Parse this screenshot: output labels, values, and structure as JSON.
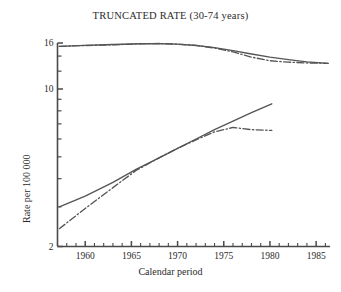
{
  "chart_data": {
    "type": "line",
    "title": "TRUNCATED RATE (30-74 years)",
    "xlabel": "Calendar period",
    "ylabel": "Rate per 100 000",
    "yscale": "log",
    "ylim": [
      2,
      16
    ],
    "xlim": [
      1957,
      1986.5
    ],
    "grid": false,
    "legend": "none",
    "ytick_labels": [
      "16",
      "10",
      "2"
    ],
    "ytick_values": [
      16,
      10,
      2
    ],
    "xtick_labels": [
      "1960",
      "1965",
      "1970",
      "1975",
      "1980",
      "1985"
    ],
    "xtick_values": [
      1960,
      1965,
      1970,
      1975,
      1980,
      1985
    ],
    "xminor_step": 1,
    "series": [
      {
        "name": "upper-fitted",
        "style": "solid",
        "color": "#555555",
        "points": [
          [
            1957.2,
            15.45
          ],
          [
            1960.0,
            15.62
          ],
          [
            1963.0,
            15.75
          ],
          [
            1966.0,
            15.88
          ],
          [
            1968.0,
            15.9
          ],
          [
            1970.0,
            15.82
          ],
          [
            1972.0,
            15.6
          ],
          [
            1974.0,
            15.25
          ],
          [
            1976.0,
            14.8
          ],
          [
            1978.0,
            14.3
          ],
          [
            1980.0,
            13.85
          ],
          [
            1982.0,
            13.5
          ],
          [
            1984.0,
            13.2
          ],
          [
            1986.3,
            13.0
          ]
        ]
      },
      {
        "name": "upper-observed",
        "style": "dashdot",
        "color": "#555555",
        "points": [
          [
            1957.2,
            15.45
          ],
          [
            1960.0,
            15.6
          ],
          [
            1963.0,
            15.7
          ],
          [
            1966.0,
            15.88
          ],
          [
            1968.0,
            15.92
          ],
          [
            1970.0,
            15.8
          ],
          [
            1972.0,
            15.62
          ],
          [
            1974.0,
            15.2
          ],
          [
            1976.0,
            14.6
          ],
          [
            1978.0,
            13.85
          ],
          [
            1980.0,
            13.35
          ],
          [
            1982.0,
            13.15
          ],
          [
            1984.0,
            13.05
          ],
          [
            1986.3,
            13.0
          ]
        ]
      },
      {
        "name": "lower-fitted",
        "style": "solid",
        "color": "#555555",
        "points": [
          [
            1957.2,
            3.0
          ],
          [
            1960.0,
            3.35
          ],
          [
            1963.0,
            3.85
          ],
          [
            1965.5,
            4.4
          ],
          [
            1968.0,
            4.95
          ],
          [
            1970.0,
            5.45
          ],
          [
            1972.0,
            6.0
          ],
          [
            1974.0,
            6.6
          ],
          [
            1976.0,
            7.2
          ],
          [
            1978.0,
            7.85
          ],
          [
            1980.2,
            8.6
          ]
        ]
      },
      {
        "name": "lower-observed",
        "style": "dashdot",
        "color": "#555555",
        "points": [
          [
            1957.2,
            2.4
          ],
          [
            1960.0,
            2.95
          ],
          [
            1963.0,
            3.65
          ],
          [
            1965.5,
            4.35
          ],
          [
            1968.0,
            4.95
          ],
          [
            1970.0,
            5.45
          ],
          [
            1972.0,
            5.95
          ],
          [
            1974.0,
            6.45
          ],
          [
            1976.0,
            6.75
          ],
          [
            1978.0,
            6.6
          ],
          [
            1980.2,
            6.55
          ]
        ]
      }
    ]
  },
  "figure": {
    "title": "TRUNCATED RATE (30-74 years)",
    "xlabel": "Calendar period",
    "ylabel": "Rate per 100 000"
  }
}
